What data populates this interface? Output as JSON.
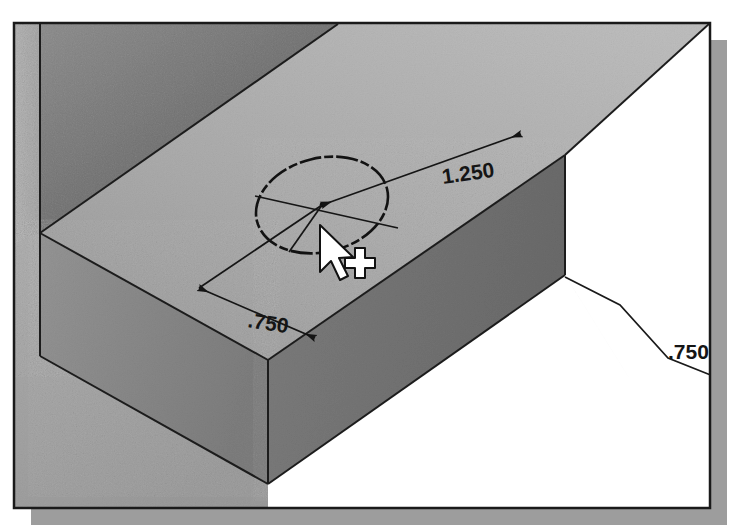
{
  "figure": {
    "background_color": "#ffffff",
    "frame": {
      "border_color": "#1a1a1a",
      "border_width": 2,
      "shadow_color": "#9a9a9a",
      "x": 14,
      "y": 23,
      "width": 696,
      "height": 485,
      "shadow_offset": 17
    },
    "model": {
      "name": "l-shaped-block",
      "faces": [
        {
          "name": "back-wall-face",
          "shade": "dark",
          "color_start": "#7e7e7e",
          "color_end": "#5a5a5a"
        },
        {
          "name": "top-face",
          "shade": "light",
          "color_start": "#b4b4b4",
          "color_end": "#8e8e8e"
        },
        {
          "name": "front-right-face",
          "shade": "medium",
          "color_start": "#8a8a8a",
          "color_end": "#6f6f6f"
        },
        {
          "name": "front-left-face",
          "shade": "medium-dark",
          "color_start": "#909090",
          "color_end": "#787878"
        },
        {
          "name": "floor-face",
          "shade": "mid-light",
          "color_start": "#a8a8a8",
          "color_end": "#8c8c8c"
        }
      ],
      "edge_color": "#1e1e1e"
    },
    "sketch": {
      "name": "circle-profile",
      "geometry_color": "#1a1a1a",
      "center_label": "circle-center-point",
      "entities": [
        "circle",
        "radius-line",
        "center-point"
      ]
    },
    "dimensions": [
      {
        "name": "dimension-1250",
        "value": "1.250",
        "orientation": "diagonal-up-right",
        "label_x": 443,
        "label_y": 178,
        "arrow_count": 2,
        "describes": "distance from circle center to back-right edge of top face"
      },
      {
        "name": "dimension-750-left",
        "value": ".750",
        "orientation": "diagonal-down-right",
        "label_x": 249,
        "label_y": 322,
        "arrow_count": 2,
        "describes": "distance from circle center to front-left edge of top face"
      },
      {
        "name": "dimension-750-leader",
        "value": ".750",
        "orientation": "leader-to-right",
        "label_x": 670,
        "label_y": 355,
        "arrow_count": 0,
        "describes": "block thickness called out with a leader line"
      }
    ],
    "cursor": {
      "name": "select-arrow-with-crosshair",
      "arrow_tip_x": 320,
      "arrow_tip_y": 225,
      "crosshair_x": 355,
      "crosshair_y": 263,
      "fill": "#ffffff",
      "outline": "#111111"
    }
  }
}
